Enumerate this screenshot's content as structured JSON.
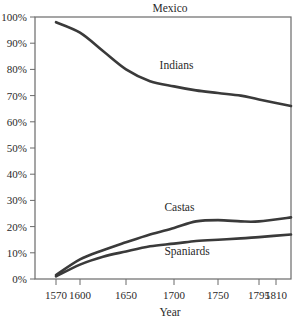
{
  "chart_data": {
    "type": "line",
    "title": "Mexico",
    "xlabel": "Year",
    "ylabel": "",
    "x_ticks": [
      1570,
      1600,
      1650,
      1700,
      1750,
      1795,
      1810
    ],
    "y_ticks": [
      "0%",
      "10%",
      "20%",
      "30%",
      "40%",
      "50%",
      "60%",
      "70%",
      "80%",
      "90%",
      "100%"
    ],
    "ylim": [
      0,
      100
    ],
    "xlim": [
      1570,
      1810
    ],
    "grid": false,
    "legend": "inline labels",
    "series": [
      {
        "name": "Indians",
        "x": [
          1570,
          1600,
          1625,
          1650,
          1675,
          1700,
          1725,
          1750,
          1775,
          1795,
          1810
        ],
        "values": [
          98,
          94,
          87,
          80,
          75.5,
          73.5,
          72,
          71,
          70,
          68.5,
          66
        ],
        "color": "#3a3a3a"
      },
      {
        "name": "Castas",
        "x": [
          1570,
          1600,
          1625,
          1650,
          1675,
          1700,
          1725,
          1750,
          1775,
          1795,
          1810
        ],
        "values": [
          1.5,
          7.5,
          11,
          14,
          17,
          19.5,
          22,
          22.5,
          22,
          22,
          23.5
        ],
        "color": "#3a3a3a"
      },
      {
        "name": "Spaniards",
        "x": [
          1570,
          1600,
          1625,
          1650,
          1675,
          1700,
          1725,
          1750,
          1775,
          1795,
          1810
        ],
        "values": [
          1,
          5.5,
          8.5,
          10.5,
          12.5,
          13.5,
          14.5,
          15,
          15.5,
          16,
          17
        ],
        "color": "#3a3a3a"
      }
    ],
    "annotations": [
      {
        "text": "Indians",
        "x": 1685,
        "y": 80
      },
      {
        "text": "Castas",
        "x": 1690,
        "y": 26
      },
      {
        "text": "Spaniards",
        "x": 1690,
        "y": 9
      }
    ]
  }
}
